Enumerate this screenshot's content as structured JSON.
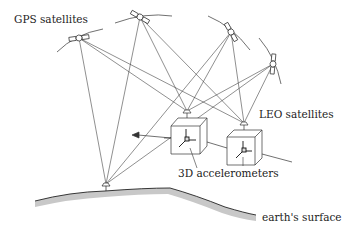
{
  "diagram": {
    "labels": {
      "gps": "GPS satellites",
      "leo": "LEO satellites",
      "accel": "3D accelerometers",
      "earth": "earth's surface"
    },
    "gps_satellites": [
      {
        "id": "gps-1",
        "x": 79,
        "y": 38
      },
      {
        "id": "gps-2",
        "x": 140,
        "y": 17
      },
      {
        "id": "gps-3",
        "x": 231,
        "y": 32
      },
      {
        "id": "gps-4",
        "x": 273,
        "y": 64
      }
    ],
    "receivers": [
      {
        "id": "leo-1",
        "x": 187,
        "y": 113
      },
      {
        "id": "leo-2",
        "x": 244,
        "y": 125
      },
      {
        "id": "ground",
        "x": 106,
        "y": 186
      }
    ],
    "colors": {
      "line": "#222222",
      "earth_fill": "#c8c8c8"
    }
  }
}
